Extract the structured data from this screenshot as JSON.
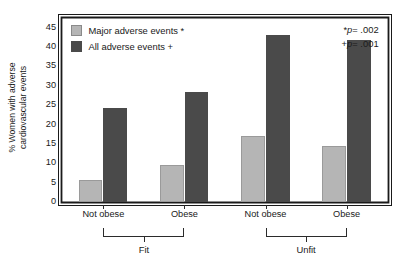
{
  "chart_data": {
    "type": "bar",
    "title": "",
    "xlabel": "",
    "ylabel_line1": "% Women with adverse",
    "ylabel_line2": "cardiovascular events",
    "categories": [
      "Not obese",
      "Obese",
      "Not obese",
      "Obese"
    ],
    "groups": [
      {
        "label": "Fit",
        "categories": [
          "Not obese",
          "Obese"
        ]
      },
      {
        "label": "Unfit",
        "categories": [
          "Not obese",
          "Obese"
        ]
      }
    ],
    "series": [
      {
        "name": "Major adverse events *",
        "color": "#b5b5b5",
        "values": [
          5.6,
          9.5,
          16.8,
          14.4
        ]
      },
      {
        "name": "All adverse events +",
        "color": "#4a4a4a",
        "values": [
          24.0,
          28.3,
          43.0,
          41.6
        ]
      }
    ],
    "ylim": [
      0,
      47
    ],
    "yticks": [
      0,
      5,
      10,
      15,
      20,
      25,
      30,
      35,
      40,
      45
    ],
    "ytick_labels": [
      "0",
      "5",
      "10",
      "15",
      "20",
      "25",
      "30",
      "35",
      "40",
      "45"
    ],
    "grid": false,
    "legend_position": "top-left",
    "annotations": [
      {
        "marker": "*",
        "text_p": "p",
        "text_rest": "= .002"
      },
      {
        "marker": "+",
        "text_p": "p",
        "text_rest": "= .001"
      }
    ]
  },
  "legend": {
    "items": [
      {
        "label": "Major adverse events *",
        "color": "#b5b5b5"
      },
      {
        "label": "All adverse events +",
        "color": "#4a4a4a"
      }
    ]
  },
  "colors": {
    "major_adverse": "#b5b5b5",
    "all_adverse": "#4a4a4a",
    "axis": "#1a1a1a",
    "background": "#ffffff"
  }
}
